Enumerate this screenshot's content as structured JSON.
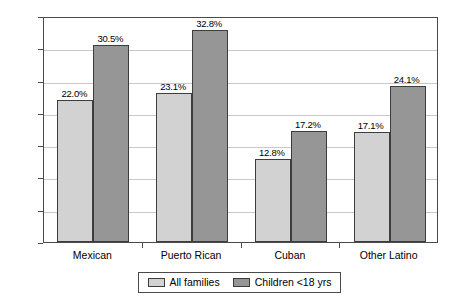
{
  "chart_data": {
    "type": "bar",
    "title": "",
    "subtitle": "",
    "xlabel": "",
    "ylabel": "",
    "categories": [
      "Mexican",
      "Puerto Rican",
      "Cuban",
      "Other Latino"
    ],
    "series": [
      {
        "name": "All families",
        "color": "#d2d2d2",
        "values": [
          22.0,
          23.1,
          12.8,
          17.1
        ],
        "labels": [
          "22.0%",
          "23.1%",
          "12.8%",
          "17.1%"
        ]
      },
      {
        "name": "Children <18 yrs",
        "color": "#969696",
        "values": [
          30.5,
          32.8,
          17.2,
          24.1
        ],
        "labels": [
          "30.5%",
          "32.8%",
          "17.2%",
          "24.1%"
        ]
      }
    ],
    "ylim": [
      0,
      35
    ],
    "ytick_values": [
      0,
      5,
      10,
      15,
      20,
      25,
      30,
      35
    ],
    "ytick_labels": [
      "0%",
      "5%",
      "10%",
      "15%",
      "20%",
      "25%",
      "30%",
      "35%"
    ],
    "grid": true,
    "grid_axis": "y",
    "legend_position": "bottom",
    "value_labels_shown": true
  },
  "axis": {
    "y": {
      "ticks": [
        {
          "label": "35%",
          "value": 35
        },
        {
          "label": "30%",
          "value": 30
        },
        {
          "label": "25%",
          "value": 25
        },
        {
          "label": "20%",
          "value": 20
        },
        {
          "label": "15%",
          "value": 15
        },
        {
          "label": "10%",
          "value": 10
        },
        {
          "label": "5%",
          "value": 5
        },
        {
          "label": "0%",
          "value": 0
        }
      ]
    },
    "x": {
      "ticks": [
        {
          "label": "Mexican"
        },
        {
          "label": "Puerto Rican"
        },
        {
          "label": "Cuban"
        },
        {
          "label": "Other Latino"
        }
      ]
    }
  },
  "bars": [
    {
      "group": "Mexican",
      "series": "All families",
      "label": "22.0%",
      "value": 22.0
    },
    {
      "group": "Mexican",
      "series": "Children <18 yrs",
      "label": "30.5%",
      "value": 30.5
    },
    {
      "group": "Puerto Rican",
      "series": "All families",
      "label": "23.1%",
      "value": 23.1
    },
    {
      "group": "Puerto Rican",
      "series": "Children <18 yrs",
      "label": "32.8%",
      "value": 32.8
    },
    {
      "group": "Cuban",
      "series": "All families",
      "label": "12.8%",
      "value": 12.8
    },
    {
      "group": "Cuban",
      "series": "Children <18 yrs",
      "label": "17.2%",
      "value": 17.2
    },
    {
      "group": "Other Latino",
      "series": "All families",
      "label": "17.1%",
      "value": 17.1
    },
    {
      "group": "Other Latino",
      "series": "Children <18 yrs",
      "label": "24.1%",
      "value": 24.1
    }
  ],
  "legend": {
    "entries": [
      {
        "label": "All families",
        "color": "#d2d2d2"
      },
      {
        "label": "Children <18 yrs",
        "color": "#969696"
      }
    ]
  },
  "colors": {
    "series_light": "#d2d2d2",
    "series_dark": "#969696",
    "bar_outline": "#3d3d3d",
    "frame": "#4a4a4a",
    "gridline": "#c8c8c8",
    "background": "#ffffff"
  }
}
